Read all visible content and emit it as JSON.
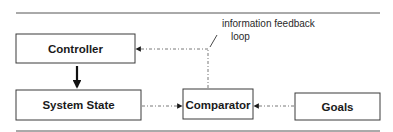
{
  "diagram": {
    "nodes": [
      {
        "id": "controller",
        "label": "Controller"
      },
      {
        "id": "system_state",
        "label": "System State"
      },
      {
        "id": "comparator",
        "label": "Comparator"
      },
      {
        "id": "goals",
        "label": "Goals"
      }
    ],
    "edges": [
      {
        "from": "controller",
        "to": "system_state",
        "style": "solid"
      },
      {
        "from": "system_state",
        "to": "comparator",
        "style": "dash-dot"
      },
      {
        "from": "goals",
        "to": "comparator",
        "style": "dash-dot"
      },
      {
        "from": "comparator",
        "to": "controller",
        "style": "dash-dot",
        "label": "information feedback loop"
      }
    ],
    "annotation": {
      "line1": "information feedback",
      "line2": "loop"
    }
  }
}
